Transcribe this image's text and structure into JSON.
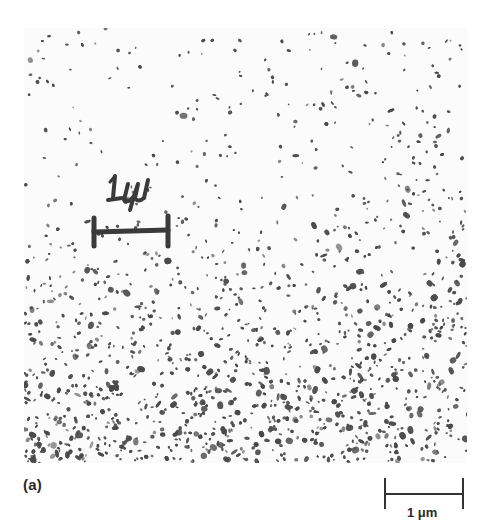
{
  "figure": {
    "panel_label": "(a)",
    "scale_bar": {
      "label": "1 μm",
      "color": "#333333"
    },
    "micrograph": {
      "description": "Electron micrograph showing dense field of dark irregular particles/islands on a light background; sparser in upper-left, denser toward bottom",
      "particle_color": "#4a4a4a",
      "background_color": "#fbfbfb",
      "handwritten_annotation": {
        "text": "1μ",
        "has_scale_marker": true
      }
    }
  }
}
